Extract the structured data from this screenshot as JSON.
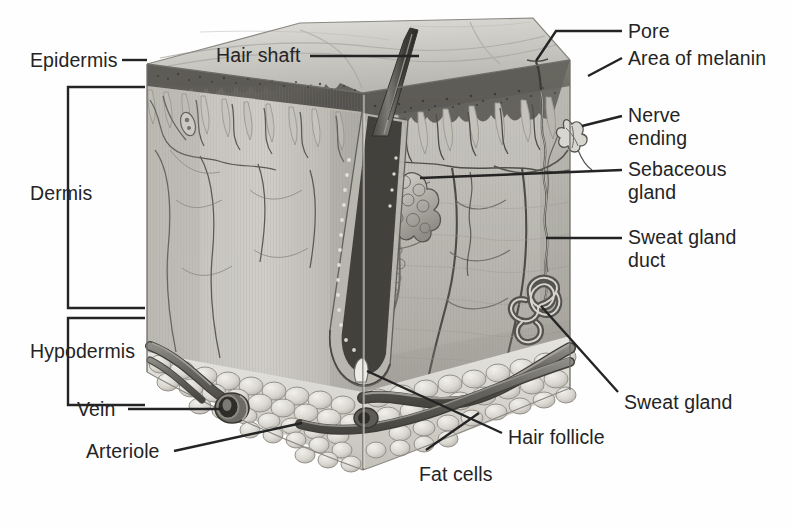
{
  "figure": {
    "kind": "anatomical-illustration",
    "background_color": "#ffffff",
    "ink_color": "#242424"
  },
  "labels": {
    "epidermis": "Epidermis",
    "dermis": "Dermis",
    "hypodermis": "Hypodermis",
    "vein": "Vein",
    "arteriole": "Arteriole",
    "hair_shaft": "Hair shaft",
    "pore": "Pore",
    "area_of_melanin": "Area of melanin",
    "nerve_ending": "Nerve\nending",
    "sebaceous_gland": "Sebaceous\ngland",
    "sweat_gland_duct": "Sweat gland\nduct",
    "sweat_gland": "Sweat gland",
    "hair_follicle": "Hair follicle",
    "fat_cells": "Fat cells"
  },
  "label_layout": [
    {
      "key": "epidermis",
      "x": 30,
      "y": 50,
      "align": "left",
      "lines": 1
    },
    {
      "key": "dermis",
      "x": 30,
      "y": 193,
      "align": "left",
      "lines": 1
    },
    {
      "key": "hypodermis",
      "x": 30,
      "y": 340,
      "align": "left",
      "lines": 1
    },
    {
      "key": "vein",
      "x": 76,
      "y": 399,
      "align": "left",
      "lines": 1
    },
    {
      "key": "arteriole",
      "x": 85,
      "y": 441,
      "align": "left",
      "lines": 1
    },
    {
      "key": "hair_shaft",
      "x": 216,
      "y": 44,
      "align": "left",
      "lines": 1
    },
    {
      "key": "pore",
      "x": 628,
      "y": 22,
      "align": "left",
      "lines": 1
    },
    {
      "key": "area_of_melanin",
      "x": 628,
      "y": 48,
      "align": "left",
      "lines": 1
    },
    {
      "key": "nerve_ending",
      "x": 628,
      "y": 103,
      "align": "left",
      "lines": 2
    },
    {
      "key": "sebaceous_gland",
      "x": 628,
      "y": 158,
      "align": "left",
      "lines": 2
    },
    {
      "key": "sweat_gland_duct",
      "x": 628,
      "y": 223,
      "align": "left",
      "lines": 2
    },
    {
      "key": "sweat_gland",
      "x": 624,
      "y": 391,
      "align": "left",
      "lines": 1
    },
    {
      "key": "hair_follicle",
      "x": 508,
      "y": 428,
      "align": "left",
      "lines": 1
    },
    {
      "key": "fat_cells",
      "x": 419,
      "y": 467,
      "align": "left",
      "lines": 1
    }
  ],
  "leader_lines": [
    {
      "for": "epidermis",
      "points": "122,60 147,60"
    },
    {
      "for": "hair_shaft",
      "points": "308,56 418,56"
    },
    {
      "for": "pore",
      "points": "554,31 622,31"
    },
    {
      "for": "area_of_melanin",
      "points": "589,75 622,60"
    },
    {
      "for": "nerve_ending",
      "points": "584,123 622,116"
    },
    {
      "for": "sebaceous_gland",
      "points": "419,176 622,168"
    },
    {
      "for": "sweat_gland_duct",
      "points": "547,237 622,237"
    },
    {
      "for": "sweat_gland",
      "points": "545,307 618,396"
    },
    {
      "for": "hair_follicle",
      "points": "366,372 502,434"
    },
    {
      "for": "fat_cells",
      "points": "427,448 478,414"
    },
    {
      "for": "vein",
      "points": "119,409 222,409"
    },
    {
      "for": "arteriole",
      "points": "172,450 301,422"
    }
  ],
  "brackets": [
    {
      "for": "dermis",
      "x_left": 67,
      "x_right": 145,
      "y_top": 87,
      "y_bottom": 308
    },
    {
      "for": "hypodermis",
      "x_left": 67,
      "x_right": 145,
      "y_top": 318,
      "y_bottom": 405
    }
  ],
  "structures": [
    "stratum corneum surface",
    "epidermal layer with melanin granules",
    "dermal papillae",
    "capillary network",
    "hair shaft",
    "hair follicle with bulb and papilla",
    "sebaceous gland",
    "sweat gland with coiled duct",
    "nerve ending (Meissner corpuscle)",
    "arteriole",
    "vein",
    "subcutaneous fat cells (adipocytes)"
  ],
  "palette": {
    "top_surface_light": "#d8d6d2",
    "top_surface_mid": "#c4c2bd",
    "epidermis_dark": "#6f6d69",
    "dermis_light": "#c9c7c2",
    "dermis_mid": "#b6b4ae",
    "dermis_shadow": "#9b998f",
    "fat_light": "#e0ded8",
    "fat_mid": "#c7c5be",
    "vessel_dark": "#5e5c58",
    "vessel_mid": "#8b8984",
    "ink": "#242424"
  }
}
